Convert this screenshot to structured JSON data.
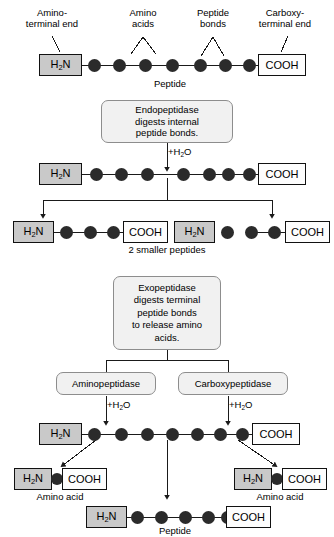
{
  "figure": {
    "colors": {
      "amino_box_fill": "#c9c9c9",
      "carboxy_box_fill": "#fdfdfd",
      "residue_fill": "#2b2b2b",
      "enzyme_box_fill": "#f1f1f1",
      "enzyme_box_border": "#8d8d8d",
      "line": "#1a1a1a",
      "background": "#ffffff"
    }
  },
  "tokens": {
    "amino_terminal": "H2N",
    "amino_terminal_pre": "H",
    "amino_terminal_sub": "2",
    "amino_terminal_post": "N",
    "carboxy_terminal": "COOH",
    "water": "+H2O",
    "water_pre": "+H",
    "water_sub": "2",
    "water_post": "O"
  },
  "panel_top": {
    "callouts": {
      "amino_terminal_end": {
        "line1": "Amino-",
        "line2": "terminal end"
      },
      "amino_acids": {
        "line1": "Amino",
        "line2": "acids"
      },
      "peptide_bonds": {
        "line1": "Peptide",
        "line2": "bonds"
      },
      "carboxy_terminal_end": {
        "line1": "Carboxy-",
        "line2": "terminal end"
      }
    },
    "chain": {
      "n_terminus": "H2N",
      "c_terminus": "COOH",
      "residue_count": 7,
      "caption": "Peptide"
    }
  },
  "panel_endopeptidase": {
    "enzyme_box": {
      "lines": [
        "Endopeptidase",
        "digests internal",
        "peptide bonds."
      ]
    },
    "reaction_label": "+H2O",
    "substrate_chain": {
      "n_terminus": "H2N",
      "c_terminus": "COOH",
      "residue_count": 7,
      "cleavage_after_residue": 3
    },
    "products": [
      {
        "n_terminus": "H2N",
        "c_terminus": "COOH",
        "residue_count": 3
      },
      {
        "n_terminus": "H2N",
        "c_terminus": "COOH",
        "residue_count": 4
      }
    ],
    "products_caption": "2 smaller peptides"
  },
  "panel_exopeptidase": {
    "enzyme_box": {
      "lines": [
        "Exopeptidase",
        "digests terminal",
        "peptide bonds",
        "to release amino",
        "acids."
      ]
    },
    "enzyme_branches": [
      {
        "label": "Aminopeptidase",
        "reaction_label": "+H2O"
      },
      {
        "label": "Carboxypeptidase",
        "reaction_label": "+H2O"
      }
    ],
    "substrate_chain": {
      "n_terminus": "H2N",
      "c_terminus": "COOH",
      "residue_count": 7,
      "cleavage_after_residue": 1,
      "cleavage_before_last_residue": true
    },
    "products": {
      "amino_acid_left": {
        "n_terminus": "H2N",
        "c_terminus": "COOH",
        "residue_count": 1,
        "caption": "Amino acid"
      },
      "amino_acid_right": {
        "n_terminus": "H2N",
        "c_terminus": "COOH",
        "residue_count": 1,
        "caption": "Amino acid"
      },
      "remaining_peptide": {
        "n_terminus": "H2N",
        "c_terminus": "COOH",
        "residue_count": 5,
        "caption": "Peptide"
      }
    }
  }
}
